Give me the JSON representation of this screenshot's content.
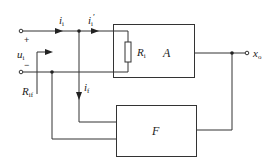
{
  "diagram": {
    "type": "feedback-amplifier-block-diagram",
    "blocks": {
      "amplifier": {
        "label": "A"
      },
      "feedback": {
        "label": "F"
      }
    },
    "components": {
      "input_resistor": {
        "label": "R",
        "subscript": "i"
      }
    },
    "labels": {
      "input_voltage": {
        "main": "u",
        "subscript": "i"
      },
      "input_current": {
        "main": "i",
        "subscript": "i"
      },
      "amp_input_current": {
        "main": "i",
        "subscript": "i",
        "prime": "′"
      },
      "feedback_current": {
        "main": "i",
        "subscript": "f"
      },
      "input_resistance_with_feedback": {
        "main": "R",
        "subscript": "if"
      },
      "output": {
        "main": "x",
        "subscript": "o"
      },
      "plus_sign": "+",
      "minus_sign": "−"
    },
    "colors": {
      "line": "#333333",
      "background": "#ffffff"
    }
  }
}
